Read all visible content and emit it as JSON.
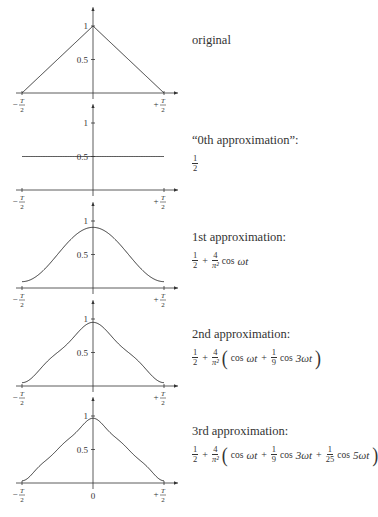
{
  "figure": {
    "panels": [
      {
        "id": "original",
        "caption": "original",
        "formula": null
      },
      {
        "id": "approx0",
        "caption": "“0th approximation”:",
        "formula": {
          "terms": [
            "1/2"
          ]
        }
      },
      {
        "id": "approx1",
        "caption": "1st approximation:",
        "formula": {
          "terms": [
            "1/2",
            "+",
            "4/π²",
            "cos ωt"
          ]
        }
      },
      {
        "id": "approx2",
        "caption": "2nd approximation:",
        "formula": {
          "terms": [
            "1/2",
            "+",
            "4/π²",
            "(cos ωt + 1/9 cos 3ωt)"
          ]
        }
      },
      {
        "id": "approx3",
        "caption": "3rd approximation:",
        "formula": {
          "terms": [
            "1/2",
            "+",
            "4/π²",
            "(cos ωt + 1/9 cos 3ωt + 1/25 cos 5ωt)"
          ]
        }
      }
    ],
    "axis_labels": {
      "x_left": "−T/2",
      "x_right": "+T/2",
      "x_zero": "0",
      "y_one": "1",
      "y_half": "0.5"
    },
    "text": {
      "half_num": "1",
      "half_den": "2",
      "four": "4",
      "pi_sq": "π²",
      "plus": "+",
      "cos": "cos",
      "wt": "ωt",
      "three_wt": "3ωt",
      "five_wt": "5ωt",
      "one": "1",
      "nine": "9",
      "twentyfive": "25",
      "lparen": "(",
      "rparen": ")"
    }
  },
  "chart_data": [
    {
      "type": "line",
      "title": "original",
      "x_domain": [
        "-T/2",
        "T/2"
      ],
      "ylim": [
        0,
        1.1
      ],
      "yticks": [
        0.5,
        1
      ],
      "xtick_labels": [
        "-T/2",
        "+T/2"
      ],
      "series": [
        {
          "name": "triangle wave",
          "x": [
            -0.5,
            0,
            0.5
          ],
          "y": [
            0,
            1,
            0
          ]
        }
      ]
    },
    {
      "type": "line",
      "title": "0th approximation",
      "formula": "1/2",
      "ylim": [
        0,
        1.1
      ],
      "yticks": [
        0.5,
        1
      ],
      "xtick_labels": [
        "-T/2",
        "+T/2"
      ],
      "series": [
        {
          "name": "constant",
          "x": [
            -0.5,
            0.5
          ],
          "y": [
            0.5,
            0.5
          ]
        }
      ]
    },
    {
      "type": "line",
      "title": "1st approximation",
      "formula": "1/2 + 4/π² cos ωt",
      "ylim": [
        0,
        1.1
      ],
      "yticks": [
        0.5,
        1
      ],
      "xtick_labels": [
        "-T/2",
        "+T/2"
      ],
      "series": [
        {
          "name": "1 harmonic",
          "x": [
            -0.5,
            -0.25,
            0,
            0.25,
            0.5
          ],
          "y": [
            0.095,
            0.5,
            0.905,
            0.5,
            0.095
          ]
        }
      ]
    },
    {
      "type": "line",
      "title": "2nd approximation",
      "formula": "1/2 + 4/π² (cos ωt + 1/9 cos 3ωt)",
      "ylim": [
        0,
        1.1
      ],
      "yticks": [
        0.5,
        1
      ],
      "xtick_labels": [
        "-T/2",
        "+T/2"
      ],
      "series": [
        {
          "name": "2 harmonics",
          "x": [
            -0.5,
            -0.25,
            0,
            0.25,
            0.5
          ],
          "y": [
            0.05,
            0.5,
            0.95,
            0.5,
            0.05
          ]
        }
      ]
    },
    {
      "type": "line",
      "title": "3rd approximation",
      "formula": "1/2 + 4/π² (cos ωt + 1/9 cos 3ωt + 1/25 cos 5ωt)",
      "ylim": [
        0,
        1.1
      ],
      "yticks": [
        0.5,
        1
      ],
      "xtick_labels": [
        "-T/2",
        "0",
        "+T/2"
      ],
      "series": [
        {
          "name": "3 harmonics",
          "x": [
            -0.5,
            -0.25,
            0,
            0.25,
            0.5
          ],
          "y": [
            0.033,
            0.5,
            0.967,
            0.5,
            0.033
          ]
        }
      ]
    }
  ]
}
